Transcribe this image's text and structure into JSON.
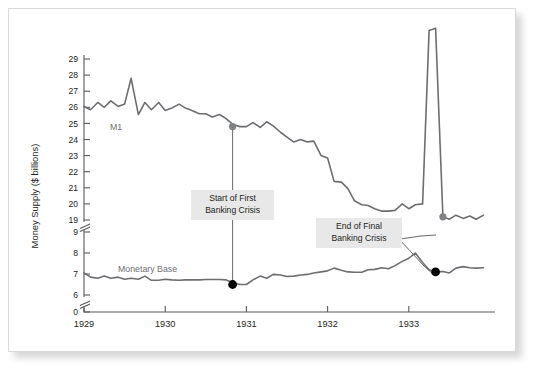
{
  "figure": {
    "background_color": "#ffffff",
    "plate_border_color": "#d9d9d9"
  },
  "chart_data": {
    "type": "line",
    "title": "",
    "xlabel": "",
    "ylabel": "Money Supply ($ billions)",
    "grid": false,
    "legend_position": "inline-labels",
    "xlim": [
      1929.0,
      1934.0
    ],
    "x_ticks": [
      "1929",
      "1930",
      "1931",
      "1932",
      "1933"
    ],
    "x_tick_values": [
      1929,
      1930,
      1931,
      1932,
      1933
    ],
    "y_ticks": [
      "29",
      "28",
      "27",
      "26",
      "25",
      "24",
      "23",
      "22",
      "21",
      "20",
      "19",
      "9",
      "8",
      "7",
      "6",
      "0"
    ],
    "y_tick_values": [
      29,
      28,
      27,
      26,
      25,
      24,
      23,
      22,
      21,
      20,
      19,
      9,
      8,
      7,
      6,
      0
    ],
    "y_axis_breaks": [
      {
        "between": [
          19,
          9
        ],
        "style": "double-slash"
      },
      {
        "between": [
          6,
          0
        ],
        "style": "double-slash"
      }
    ],
    "series": [
      {
        "name": "M1",
        "label": "M1",
        "color": "#6d6e71",
        "stroke_width": 1.6,
        "x": [
          1929.0,
          1929.08,
          1929.17,
          1929.25,
          1929.33,
          1929.42,
          1929.5,
          1929.58,
          1929.67,
          1929.75,
          1929.83,
          1929.92,
          1930.0,
          1930.08,
          1930.17,
          1930.25,
          1930.33,
          1930.42,
          1930.5,
          1930.58,
          1930.67,
          1930.75,
          1930.83,
          1930.92,
          1931.0,
          1931.08,
          1931.17,
          1931.25,
          1931.33,
          1931.42,
          1931.5,
          1931.58,
          1931.67,
          1931.75,
          1931.83,
          1931.92,
          1932.0,
          1932.08,
          1932.17,
          1932.25,
          1932.33,
          1932.42,
          1932.5,
          1932.58,
          1932.67,
          1932.75,
          1932.83,
          1932.92,
          1933.0,
          1933.08,
          1933.17,
          1933.25,
          1933.33,
          1933.42,
          1933.5,
          1933.58,
          1933.67,
          1933.75,
          1933.83,
          1933.92
        ],
        "values": [
          26.05,
          25.85,
          26.3,
          26.0,
          26.4,
          26.05,
          26.2,
          27.8,
          25.55,
          26.3,
          25.85,
          26.3,
          25.8,
          25.95,
          26.2,
          25.95,
          25.8,
          25.6,
          25.6,
          25.4,
          25.55,
          25.3,
          24.95,
          24.8,
          24.8,
          25.05,
          24.75,
          25.1,
          24.85,
          24.45,
          24.15,
          23.85,
          24.0,
          23.85,
          23.9,
          23.0,
          22.85,
          21.4,
          21.35,
          20.95,
          20.2,
          19.95,
          19.9,
          19.7,
          19.55,
          19.55,
          19.6,
          20.0,
          19.7,
          19.95,
          20.0,
          18.6,
          18.7,
          19.2,
          19.05,
          19.3,
          19.1,
          19.25,
          19.05,
          19.3
        ],
        "markers": [
          {
            "x": 1930.83,
            "y": 24.8,
            "color": "#808285",
            "radius": 3.6,
            "label": "Start of First Banking Crisis"
          },
          {
            "x": 1933.42,
            "y": 19.2,
            "color": "#808285",
            "radius": 3.6,
            "label": "End of Final Banking Crisis"
          }
        ]
      },
      {
        "name": "Monetary Base",
        "label": "Monetary Base",
        "color": "#6d6e71",
        "stroke_width": 1.6,
        "x": [
          1929.0,
          1929.08,
          1929.17,
          1929.25,
          1929.33,
          1929.42,
          1929.5,
          1929.58,
          1929.67,
          1929.75,
          1929.83,
          1929.92,
          1930.0,
          1930.08,
          1930.17,
          1930.25,
          1930.33,
          1930.42,
          1930.5,
          1930.58,
          1930.67,
          1930.75,
          1930.83,
          1930.92,
          1931.0,
          1931.08,
          1931.17,
          1931.25,
          1931.33,
          1931.42,
          1931.5,
          1931.58,
          1931.67,
          1931.75,
          1931.83,
          1931.92,
          1932.0,
          1932.08,
          1932.17,
          1932.25,
          1932.33,
          1932.42,
          1932.5,
          1932.58,
          1932.67,
          1932.75,
          1932.83,
          1932.92,
          1933.0,
          1933.08,
          1933.17,
          1933.25,
          1933.33,
          1933.42,
          1933.5,
          1933.58,
          1933.67,
          1933.75,
          1933.83,
          1933.92
        ],
        "values": [
          7.05,
          6.85,
          6.8,
          6.9,
          6.8,
          6.85,
          6.75,
          6.8,
          6.75,
          6.9,
          6.7,
          6.7,
          6.75,
          6.72,
          6.7,
          6.72,
          6.72,
          6.72,
          6.74,
          6.74,
          6.74,
          6.72,
          6.6,
          6.5,
          6.5,
          6.72,
          6.9,
          6.8,
          6.98,
          6.95,
          6.88,
          6.9,
          6.95,
          6.98,
          7.05,
          7.1,
          7.15,
          7.28,
          7.18,
          7.1,
          7.08,
          7.08,
          7.2,
          7.22,
          7.3,
          7.25,
          7.4,
          7.6,
          7.75,
          8.0,
          7.55,
          7.2,
          7.1,
          7.12,
          7.05,
          7.28,
          7.35,
          7.3,
          7.28,
          7.3
        ],
        "markers": [
          {
            "x": 1930.83,
            "y": 6.5,
            "color": "#000000",
            "radius": 4.4,
            "label": "Start of First Banking Crisis"
          },
          {
            "x": 1933.33,
            "y": 7.1,
            "color": "#000000",
            "radius": 4.4,
            "label": "End of Final Banking Crisis"
          }
        ]
      }
    ],
    "annotations": [
      {
        "id": "start-first-banking-crisis",
        "lines": [
          "Start of First",
          "Banking Crisis"
        ],
        "text": "Start of First Banking Crisis",
        "box_color": "#e8e8e8",
        "connector": "vertical-line",
        "at_x": 1930.83
      },
      {
        "id": "end-final-banking-crisis",
        "lines": [
          "End of Final",
          "Banking Crisis"
        ],
        "text": "End of Final Banking Crisis",
        "box_color": "#e8e8e8",
        "connector": "two-leader-lines",
        "at_x": 1933.4
      }
    ]
  }
}
